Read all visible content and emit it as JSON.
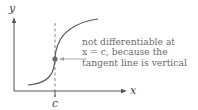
{
  "diagram": {
    "type": "function-graph",
    "axes": {
      "x_label": "x",
      "y_label": "y",
      "tick_label": "c"
    },
    "annotation": {
      "lines": [
        "not differentiable at",
        "x = c, because the",
        "tangent line is vertical"
      ]
    },
    "colors": {
      "axis": "#555555",
      "curve": "#5a5a5a",
      "point": "#6a6a6a",
      "text": "#6a6a6a"
    }
  }
}
